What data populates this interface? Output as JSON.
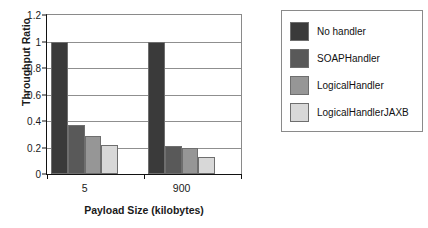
{
  "chart_data": {
    "type": "bar",
    "title": "",
    "subtitle": "",
    "xlabel": "Payload Size (kilobytes)",
    "ylabel": "Throughput Ratio",
    "categories": [
      "5",
      "900"
    ],
    "ylim": [
      0,
      1.2
    ],
    "yticks": [
      "0",
      "0.2",
      "0.4",
      "0.6",
      "0.8",
      "1",
      "1.2"
    ],
    "ytick_values": [
      0,
      0.2,
      0.4,
      0.6,
      0.8,
      1,
      1.2
    ],
    "grid": "horizontal",
    "legend_position": "right",
    "series": [
      {
        "name": "No handler",
        "color": "#3a3a3a",
        "values": [
          1.0,
          1.0
        ]
      },
      {
        "name": "SOAPHandler",
        "color": "#595959",
        "values": [
          0.37,
          0.21
        ]
      },
      {
        "name": "LogicalHandler",
        "color": "#969696",
        "values": [
          0.29,
          0.2
        ]
      },
      {
        "name": "LogicalHandlerJAXB",
        "color": "#d8d8d8",
        "values": [
          0.22,
          0.13
        ]
      }
    ]
  }
}
